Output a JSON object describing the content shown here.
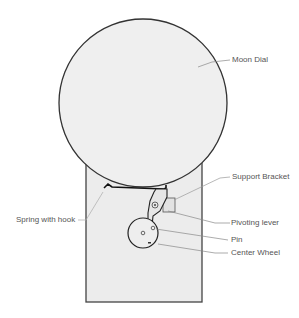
{
  "diagram": {
    "labels": {
      "moon_dial": "Moon Dial",
      "support_bracket": "Support Bracket",
      "spring_with_hook": "Spring with hook",
      "pivoting_lever": "Pivoting lever",
      "pin": "Pin",
      "center_wheel": "Center Wheel"
    },
    "colors": {
      "fill": "#efefef",
      "stroke": "#333333",
      "leader": "#888888",
      "label_text": "#555555"
    }
  }
}
